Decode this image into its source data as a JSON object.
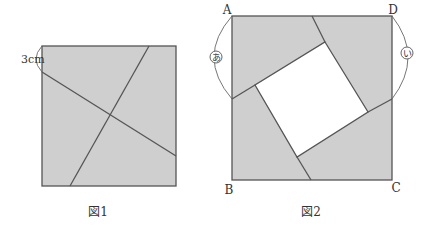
{
  "colors": {
    "fill": "#cfcfcf",
    "line": "#555555",
    "background": "#ffffff",
    "hole": "#ffffff"
  },
  "figure1": {
    "caption": "図1",
    "measure_label": "3cm",
    "square": {
      "x1": 42,
      "y1": 46,
      "x2": 176,
      "y2": 186
    },
    "cut_lines": [
      {
        "from": [
          42,
          72
        ],
        "to": [
          176,
          156
        ]
      },
      {
        "from": [
          149,
          46
        ],
        "to": [
          70,
          186
        ]
      }
    ]
  },
  "figure2": {
    "caption": "図2",
    "vertices": {
      "A": "A",
      "B": "B",
      "C": "C",
      "D": "D"
    },
    "arc_labels": {
      "left": "あ",
      "right": "い"
    },
    "square": {
      "x1": 232,
      "y1": 16,
      "x2": 392,
      "y2": 180
    },
    "inner_square": [
      [
        325,
        42
      ],
      [
        368,
        112
      ],
      [
        297,
        157
      ],
      [
        255,
        85
      ]
    ]
  }
}
